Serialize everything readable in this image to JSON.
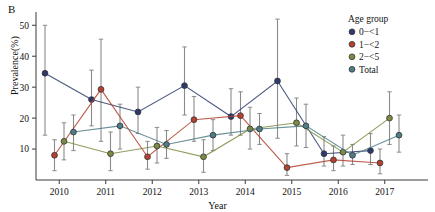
{
  "panel": {
    "label": "B"
  },
  "axes": {
    "ylabel": "Prevalence(%)",
    "xlabel": "Year",
    "yticks": [
      "10",
      "20",
      "30",
      "40",
      "50"
    ],
    "xticks": [
      "2010",
      "2011",
      "2012",
      "2013",
      "2014",
      "2015",
      "2016",
      "2017"
    ]
  },
  "legend": {
    "title": "Age group",
    "items": [
      {
        "label": "0−<1",
        "color": "#2b3a6b"
      },
      {
        "label": "1−<2",
        "color": "#b5412f"
      },
      {
        "label": "2−<5",
        "color": "#7a8c3f"
      },
      {
        "label": "Total",
        "color": "#4f7d85"
      }
    ]
  },
  "colors": {
    "errorbar": "#8a8a8a",
    "axis": "#3a3a3a",
    "background": "#ffffff"
  },
  "chart_data": {
    "type": "line",
    "title": "",
    "xlabel": "Year",
    "ylabel": "Prevalence(%)",
    "categories": [
      "2010",
      "2011",
      "2012",
      "2013",
      "2014",
      "2015",
      "2016",
      "2017"
    ],
    "ylim": [
      0,
      53
    ],
    "yticks": [
      10,
      20,
      30,
      40,
      50
    ],
    "grid": false,
    "legend_position": "top-right",
    "error_bars": "95% CI",
    "series": [
      {
        "name": "0−<1",
        "color": "#2b3a6b",
        "values": [
          34.5,
          26.0,
          22.0,
          30.5,
          20.5,
          32.0,
          8.5,
          9.5
        ],
        "ci_low": [
          14.5,
          17.5,
          15.0,
          21.0,
          14.5,
          13.5,
          4.5,
          5.0
        ],
        "ci_high": [
          50.0,
          35.5,
          30.0,
          43.0,
          29.5,
          52.0,
          14.0,
          15.0
        ]
      },
      {
        "name": "1−<2",
        "color": "#b5412f",
        "values": [
          8.0,
          29.3,
          7.5,
          19.5,
          20.8,
          4.0,
          6.5,
          5.5
        ],
        "ci_low": [
          3.0,
          12.5,
          3.5,
          12.5,
          14.5,
          1.5,
          3.0,
          2.0
        ],
        "ci_high": [
          13.0,
          45.5,
          12.5,
          27.0,
          28.5,
          8.5,
          11.0,
          10.0
        ]
      },
      {
        "name": "2−<5",
        "color": "#7a8c3f",
        "values": [
          12.5,
          8.5,
          11.0,
          7.5,
          16.5,
          18.5,
          9.0,
          20.0
        ],
        "ci_low": [
          6.5,
          3.0,
          5.5,
          2.5,
          10.0,
          11.0,
          4.5,
          11.5
        ],
        "ci_high": [
          18.5,
          15.5,
          17.0,
          13.0,
          23.5,
          26.5,
          14.5,
          28.5
        ]
      },
      {
        "name": "Total",
        "color": "#4f7d85",
        "values": [
          15.5,
          17.5,
          11.5,
          14.5,
          16.5,
          17.5,
          8.0,
          14.5
        ],
        "ci_low": [
          9.5,
          10.0,
          7.0,
          9.5,
          11.5,
          10.5,
          5.0,
          9.0
        ],
        "ci_high": [
          21.0,
          24.5,
          16.0,
          19.5,
          21.5,
          24.5,
          11.5,
          21.0
        ]
      }
    ]
  }
}
